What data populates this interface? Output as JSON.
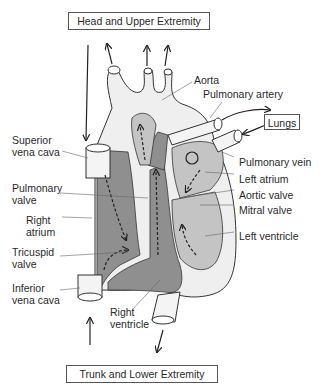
{
  "diagram": {
    "boxes": {
      "top": "Head and Upper Extremity",
      "bottom": "Trunk and Lower Extremity",
      "lungs": "Lungs"
    },
    "labels": {
      "aorta": "Aorta",
      "pulmonary_artery": "Pulmonary artery",
      "pulmonary_vein": "Pulmonary vein",
      "left_atrium": "Left atrium",
      "aortic_valve": "Aortic valve",
      "mitral_valve": "Mitral valve",
      "left_ventricle": "Left ventricle",
      "superior_vena_cava_1": "Superior",
      "superior_vena_cava_2": "vena cava",
      "pulmonary_valve_1": "Pulmonary",
      "pulmonary_valve_2": "valve",
      "right_atrium_1": "Right",
      "right_atrium_2": "atrium",
      "tricuspid_valve_1": "Tricuspid",
      "tricuspid_valve_2": "valve",
      "inferior_vena_cava_1": "Inferior",
      "inferior_vena_cava_2": "vena cava",
      "right_ventricle_1": "Right",
      "right_ventricle_2": "ventricle"
    },
    "colors": {
      "deoxygenated": "#8f8f8f",
      "oxygenated": "#c4c4c4",
      "wall": "#efefef",
      "outline": "#333333"
    }
  }
}
